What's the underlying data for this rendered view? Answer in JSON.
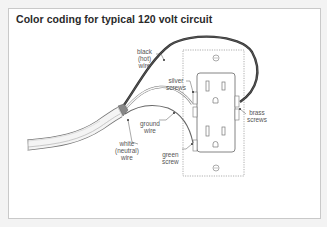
{
  "title": "Color coding for typical 120 volt circuit",
  "labels": {
    "black_wire": [
      "black",
      "(hot)",
      "wire"
    ],
    "silver_screws": [
      "silver",
      "screws"
    ],
    "brass_screws": [
      "brass",
      "screws"
    ],
    "ground_wire": [
      "ground",
      "wire"
    ],
    "white_wire": [
      "white",
      "(neutral)",
      "wire"
    ],
    "green_screw": [
      "green",
      "screw"
    ]
  },
  "colors": {
    "background": "#f3f3f3",
    "card": "#ffffff",
    "border": "#c9c9c9",
    "line_art": "#555555",
    "black_wire": "#3a3a3a",
    "box_outline": "#9a9a9a"
  }
}
